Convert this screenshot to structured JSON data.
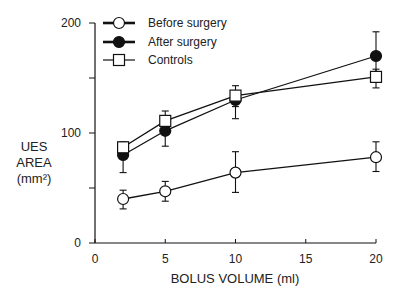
{
  "chart_data": {
    "type": "line",
    "title": "",
    "xlabel": "BOLUS VOLUME (ml)",
    "ylabel": "UES AREA (mm²)",
    "ylabel_lines": [
      "UES",
      "AREA",
      "(mm²)"
    ],
    "xlim": [
      0,
      20
    ],
    "ylim": [
      0,
      200
    ],
    "xticks": [
      0,
      5,
      10,
      15,
      20
    ],
    "yticks": [
      0,
      50,
      100,
      150,
      200
    ],
    "ytick_labels": [
      "0",
      "",
      "100",
      "",
      "200"
    ],
    "grid": false,
    "legend_position": "upper left",
    "x": [
      2,
      5,
      10,
      20
    ],
    "series": [
      {
        "name": "Before surgery",
        "marker": "open-circle",
        "values": [
          40,
          47,
          64,
          78
        ],
        "error_upper": [
          48,
          56,
          83,
          92
        ],
        "error_lower": [
          31,
          38,
          46,
          65
        ]
      },
      {
        "name": "After surgery",
        "marker": "filled-circle",
        "values": [
          80,
          102,
          130,
          170
        ],
        "error_upper": [
          87,
          112,
          138,
          192
        ],
        "error_lower": [
          64,
          88,
          113,
          155
        ]
      },
      {
        "name": "Controls",
        "marker": "open-square",
        "values": [
          87,
          111,
          134,
          151
        ],
        "error_upper": [
          92,
          120,
          143,
          158
        ],
        "error_lower": [
          80,
          102,
          124,
          141
        ]
      }
    ]
  },
  "colors": {
    "ink": "#111111",
    "background": "#ffffff"
  }
}
